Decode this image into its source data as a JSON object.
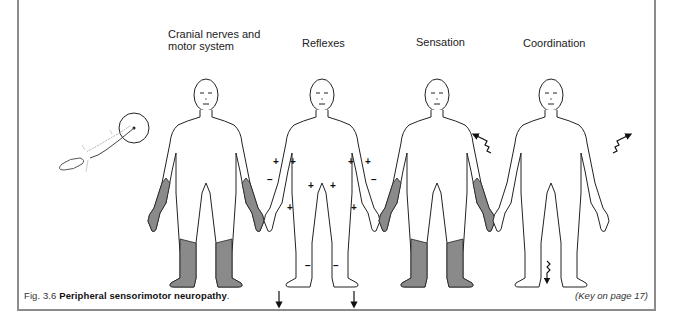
{
  "figure": {
    "panels": [
      {
        "id": "cranial",
        "label_line1": "Cranial nerves and",
        "label_line2": "motor system",
        "affected": "distal limbs shaded (hands, forearms, lower legs, feet)"
      },
      {
        "id": "reflexes",
        "label": "Reflexes",
        "marks": {
          "arms_plus": 4,
          "arms_minus": 2,
          "knees_plus": 2,
          "thighs_plus": 2,
          "ankles_minus": 2,
          "plantar_down_arrows": 2
        }
      },
      {
        "id": "sensation",
        "label": "Sensation",
        "affected": "distal limbs shaded (glove and stocking)"
      },
      {
        "id": "coordination",
        "label": "Coordination",
        "marks": {
          "arm_wavy_arrows": 2,
          "leg_wavy_arrow": 1
        }
      }
    ],
    "inset": "peripheral nerve / neuron diagram with circled terminal",
    "caption": {
      "prefix": "Fig. 3.6",
      "title": "Peripheral sensorimotor neuropathy",
      "suffix": "."
    },
    "key_note": "(Key on page 17)"
  },
  "colors": {
    "shade": "#8a8a8a",
    "frame": "#8c8c8c",
    "outline": "#222222"
  }
}
